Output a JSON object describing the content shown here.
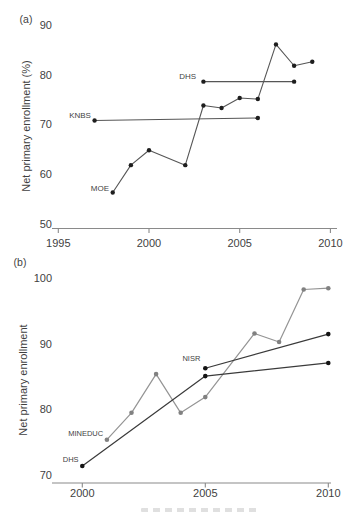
{
  "page": {
    "background": "#ffffff",
    "description_visible_panels": [
      "(a)",
      "(b)"
    ]
  },
  "chart_data": [
    {
      "id": "panel-a",
      "type": "line",
      "panel_label": "(a)",
      "title": "",
      "xlabel": "",
      "ylabel": "Net primary enrollment (%)",
      "xlim": [
        1995,
        2010
      ],
      "ylim": [
        50,
        90
      ],
      "xticks": [
        1995,
        2000,
        2005,
        2010
      ],
      "yticks": [
        90,
        80,
        70,
        60,
        50
      ],
      "grid": false,
      "legend": "inline-series-labels",
      "axis_color": "#8a8a8a",
      "text_color": "#3f3f3f",
      "series": [
        {
          "name": "MOE",
          "x": [
            1998,
            1999,
            2000,
            2002,
            2003,
            2004,
            2005,
            2006,
            2007,
            2008,
            2009
          ],
          "y": [
            56.5,
            62,
            65,
            62,
            74,
            73.5,
            75.5,
            75.3,
            86.3,
            82,
            82.8
          ],
          "line_color": "#565656",
          "point_color": "#1e1e1e",
          "label": {
            "text": "MOE",
            "x": 1997.8,
            "y": 57.3,
            "color": "#454545",
            "anchor": "end"
          }
        },
        {
          "name": "KNBS",
          "x": [
            1997,
            2006
          ],
          "y": [
            71,
            71.5
          ],
          "line_color": "#565656",
          "point_color": "#1e1e1e",
          "label": {
            "text": "KNBS",
            "x": 1996.8,
            "y": 72.0,
            "color": "#454545",
            "anchor": "end"
          }
        },
        {
          "name": "DHS",
          "x": [
            2003,
            2008
          ],
          "y": [
            78.8,
            78.8
          ],
          "line_color": "#565656",
          "point_color": "#1e1e1e",
          "label": {
            "text": "DHS",
            "x": 2002.6,
            "y": 79.7,
            "color": "#454545",
            "anchor": "end"
          }
        }
      ]
    },
    {
      "id": "panel-b",
      "type": "line",
      "panel_label": "(b)",
      "title": "",
      "xlabel": "",
      "ylabel": "Net primary enrollment",
      "xlim": [
        2000,
        2010
      ],
      "ylim": [
        70,
        100
      ],
      "xticks": [
        2000,
        2005,
        2010
      ],
      "yticks": [
        100,
        90,
        80,
        70
      ],
      "grid": false,
      "legend": "inline-series-labels",
      "axis_color": "#8a8a8a",
      "text_color": "#3f3f3f",
      "series": [
        {
          "name": "MINEDUC",
          "x": [
            2001,
            2002,
            2003,
            2004,
            2005,
            2007,
            2008,
            2009,
            2010
          ],
          "y": [
            75.5,
            79.6,
            85.5,
            79.6,
            82,
            91.7,
            90.4,
            98.4,
            98.6
          ],
          "line_color": "#949494",
          "point_color": "#818181",
          "label": {
            "text": "MINEDUC",
            "x": 2000.85,
            "y": 76.3,
            "color": "#9b9b9b",
            "anchor": "end"
          }
        },
        {
          "name": "DHS",
          "x": [
            2000,
            2005,
            2010
          ],
          "y": [
            71.5,
            85.2,
            87.2
          ],
          "line_color": "#3a3a3a",
          "point_color": "#141414",
          "label": {
            "text": "DHS",
            "x": 1999.85,
            "y": 72.4,
            "color": "#333333",
            "anchor": "end"
          }
        },
        {
          "name": "NISR",
          "x": [
            2005,
            2010
          ],
          "y": [
            86.4,
            91.6
          ],
          "line_color": "#3a3a3a",
          "point_color": "#141414",
          "label": {
            "text": "NISR",
            "x": 2004.8,
            "y": 87.8,
            "color": "#333333",
            "anchor": "end"
          }
        }
      ]
    }
  ]
}
